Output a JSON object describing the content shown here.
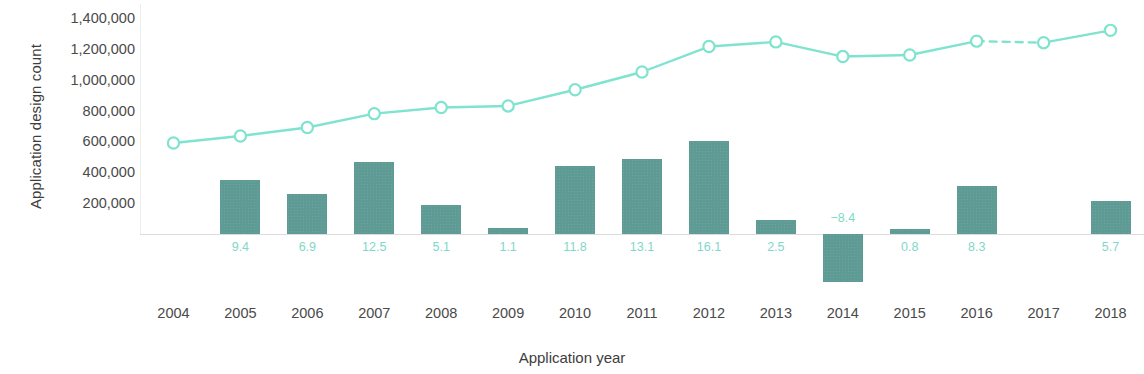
{
  "chart_data": {
    "type": "bar",
    "title": "",
    "xlabel": "Application year",
    "ylabel": "Application design count",
    "categories": [
      "2004",
      "2005",
      "2006",
      "2007",
      "2008",
      "2009",
      "2010",
      "2011",
      "2012",
      "2013",
      "2014",
      "2015",
      "2016",
      "2017",
      "2018"
    ],
    "ytick_labels": [
      "200,000",
      "400,000",
      "600,000",
      "800,000",
      "1,000,000",
      "1,200,000",
      "1,400,000"
    ],
    "ytick_values": [
      200000,
      400000,
      600000,
      800000,
      1000000,
      1200000,
      1400000
    ],
    "ylim": [
      -340000,
      1450000
    ],
    "grid": false,
    "legend": null,
    "series": [
      {
        "name": "Application design count",
        "type": "line",
        "color": "#7fe3cf",
        "marker": "open-circle",
        "values": [
          590000,
          635000,
          690000,
          780000,
          820000,
          830000,
          935000,
          1050000,
          1215000,
          1245000,
          1150000,
          1160000,
          1250000,
          1240000,
          1320000
        ],
        "dashed_segments": [
          [
            12,
            13
          ]
        ]
      },
      {
        "name": "Growth rate (%)",
        "type": "bar",
        "color": "#5f9b95",
        "values": [
          null,
          9.4,
          6.9,
          12.5,
          5.1,
          1.1,
          11.8,
          13.1,
          16.1,
          2.5,
          -8.4,
          0.8,
          8.3,
          null,
          5.7
        ],
        "data_labels": [
          "",
          "9.4",
          "6.9",
          "12.5",
          "5.1",
          "1.1",
          "11.8",
          "13.1",
          "16.1",
          "2.5",
          "−8.4",
          "0.8",
          "8.3",
          "",
          "5.7"
        ]
      }
    ]
  }
}
